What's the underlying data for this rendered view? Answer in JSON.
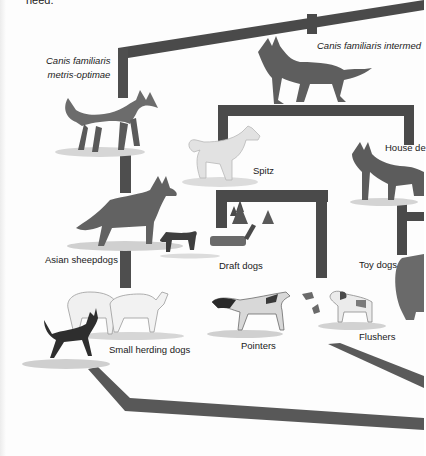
{
  "page": {
    "cut_off_top_text": "need."
  },
  "diagram": {
    "colors": {
      "branch": "#4f4f4f",
      "branch_light": "#6a6a6a",
      "ground": "#c9c9c9",
      "text": "#1a1a1a"
    },
    "nodes": [
      {
        "id": "metris-optimae",
        "label_line1": "Canis familiaris",
        "label_line2": "metris-optimae",
        "italic": true
      },
      {
        "id": "intermedius",
        "label": "Canis familiaris intermed",
        "italic": true
      },
      {
        "id": "spitz",
        "label": "Spitz"
      },
      {
        "id": "house-dogs",
        "label": "House de"
      },
      {
        "id": "asian-sheepdogs",
        "label": "Asian sheepdogs"
      },
      {
        "id": "draft-dogs",
        "label": "Draft dogs"
      },
      {
        "id": "toy-dogs",
        "label": "Toy dogs"
      },
      {
        "id": "small-herding-dogs",
        "label": "Small herding dogs"
      },
      {
        "id": "pointers",
        "label": "Pointers"
      },
      {
        "id": "flushers",
        "label": "Flushers"
      }
    ]
  }
}
